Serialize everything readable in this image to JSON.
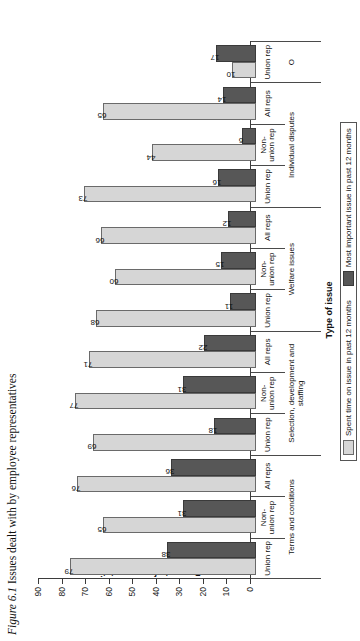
{
  "caption": {
    "figure_number": "Figure 6.1",
    "text": "Issues dealt with by employee representatives"
  },
  "chart_data": {
    "type": "bar",
    "title": "Issues dealt with by employee representatives",
    "xlabel": "Type of issue",
    "ylabel": "Per cent of representatives",
    "ylim": [
      0,
      90
    ],
    "yticks": [
      90,
      80,
      70,
      60,
      50,
      40,
      30,
      20,
      10,
      0
    ],
    "grid": false,
    "orientation": "vertical-bars",
    "legend_position": "bottom",
    "legend": [
      "Spent time on issue in past 12 months",
      "Most important issue in past 12 months"
    ],
    "colors": {
      "spent_time": "#d6d6d6",
      "most_important": "#575757",
      "axis": "#3b3b3b"
    },
    "groups": [
      {
        "name": "Terms and conditions",
        "categories": [
          "Union rep",
          "Non-union rep",
          "All reps"
        ],
        "spent_time": [
          79,
          65,
          76
        ],
        "most_important": [
          38,
          31,
          36
        ]
      },
      {
        "name": "Selection, development and staffing",
        "categories": [
          "Union rep",
          "Non-union rep",
          "All reps"
        ],
        "spent_time": [
          69,
          77,
          71
        ],
        "most_important": [
          18,
          31,
          22
        ]
      },
      {
        "name": "Welfare issues",
        "categories": [
          "Union rep",
          "Non-union rep",
          "All reps"
        ],
        "spent_time": [
          68,
          60,
          66
        ],
        "most_important": [
          11,
          15,
          12
        ]
      },
      {
        "name": "Individual disputes",
        "categories": [
          "Union rep",
          "Non-union rep",
          "All reps"
        ],
        "spent_time": [
          73,
          44,
          65
        ],
        "most_important": [
          16,
          6,
          14
        ]
      },
      {
        "name": "O",
        "categories": [
          "Union rep"
        ],
        "spent_time": [
          10
        ],
        "most_important": [
          17
        ]
      }
    ]
  }
}
